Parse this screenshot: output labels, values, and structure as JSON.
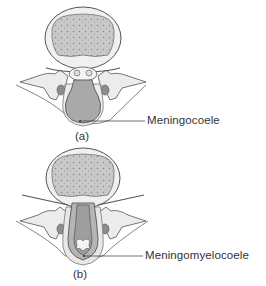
{
  "figures": [
    {
      "id": "a",
      "caption": "(a)",
      "label": "Meningocoele",
      "description": "Vertebral cross-section with meningeal sac protruding posteriorly, filled with CSF (no neural tissue)"
    },
    {
      "id": "b",
      "caption": "(b)",
      "label": "Meningomyelocoele",
      "description": "Vertebral cross-section with sac containing spinal cord and nerve roots protruding posteriorly"
    }
  ],
  "colors": {
    "outline": "#555555",
    "bone_fill": "#f2f2f2",
    "marrow_fill": "#b8b8b8",
    "sac_fill": "#a9a9a9",
    "skin_fill": "#e6e6e6",
    "text": "#333333"
  }
}
